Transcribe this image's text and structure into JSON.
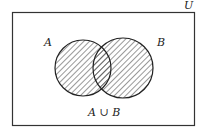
{
  "diagram": {
    "type": "venn",
    "universe_label": "U",
    "sets": [
      {
        "label": "A"
      },
      {
        "label": "B"
      }
    ],
    "shaded_region": "A ∪ B",
    "caption": "A ∪ B",
    "colors": {
      "stroke": "#222222",
      "hatch": "#333333",
      "background": "#ffffff"
    }
  }
}
